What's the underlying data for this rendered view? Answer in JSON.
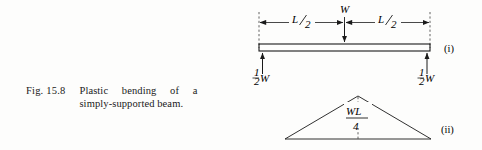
{
  "caption": {
    "number": "Fig. 15.8",
    "text": "Plastic bending of a simply-supported beam."
  },
  "figure": {
    "parts": [
      {
        "id": "i",
        "label": "(i)",
        "description": "simply-supported beam with central point load"
      },
      {
        "id": "ii",
        "label": "(ii)",
        "description": "triangular bending moment diagram"
      }
    ],
    "beam_diagram": {
      "dimension_left": {
        "numerator": "L",
        "denominator": "2",
        "text": "L/2"
      },
      "dimension_right": {
        "numerator": "L",
        "denominator": "2",
        "text": "L/2"
      },
      "load_label": "W",
      "reaction_left": {
        "fraction_numerator": "1",
        "fraction_denominator": "2",
        "symbol": "W",
        "text": "1/2 W"
      },
      "reaction_right": {
        "fraction_numerator": "1",
        "fraction_denominator": "2",
        "symbol": "W",
        "text": "1/2 W"
      }
    },
    "moment_diagram": {
      "peak_label": {
        "numerator": "WL",
        "denominator": "4",
        "text": "WL/4"
      }
    }
  },
  "colors": {
    "ink": "#1a1a1a",
    "paper": "#fdfdfc",
    "rule": "#2a2a2a"
  }
}
